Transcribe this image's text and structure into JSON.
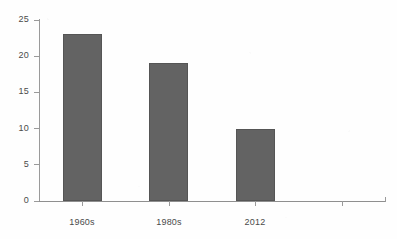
{
  "chart_data": {
    "type": "bar",
    "title": "",
    "subtitle": "",
    "xlabel": "",
    "ylabel": "",
    "categories": [
      "1960s",
      "1980s",
      "2012",
      ""
    ],
    "values": [
      23,
      19,
      10,
      null
    ],
    "series": [
      {
        "name": "",
        "values": [
          23,
          19,
          10,
          null
        ]
      }
    ],
    "ylim": [
      0,
      25
    ],
    "y_ticks": [
      "0",
      "5",
      "10",
      "15",
      "20",
      "25"
    ],
    "y_tick_values": [
      0,
      5,
      10,
      15,
      20,
      25
    ],
    "x_ticks": [
      "1960s",
      "1980s",
      "2012",
      ""
    ],
    "grid": false,
    "legend": false,
    "legend_position": "none",
    "annotations": [],
    "bar_color": "#636363",
    "bar_edge_color": "#555555",
    "axis_color": "#9a9a9a",
    "tick_label_color": "#4a4a4a",
    "background_color": "#ffffff"
  }
}
